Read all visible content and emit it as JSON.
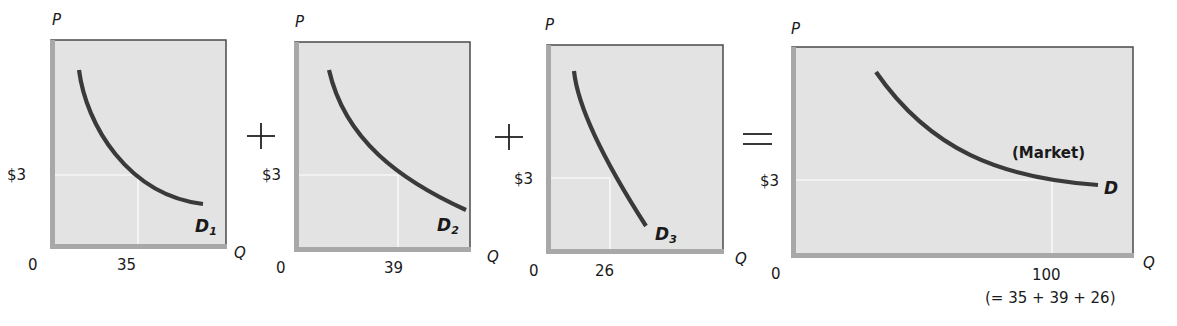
{
  "chart_data": {
    "type": "line",
    "colors": {
      "panel_fill": "#e3e3e3",
      "axis_band": "#a8a8a8",
      "border": "#4a4a4a",
      "curve": "#3a3a3a",
      "guide": "#ffffff"
    },
    "operators": [
      "+",
      "+",
      "="
    ],
    "panels": [
      {
        "id": "panel-1",
        "ylabel": "P",
        "xlabel": "Q",
        "origin": "0",
        "price_tick": "$3",
        "qty_tick": "35",
        "curve_label": "D",
        "curve_sub": "1",
        "price": 3,
        "quantity": 35,
        "box": [
          51,
          40,
          226,
          248
        ],
        "guide": {
          "y": 175,
          "x": 138
        },
        "curve": "M79,70 C86,125 128,195 203,204"
      },
      {
        "id": "panel-2",
        "ylabel": "P",
        "xlabel": "Q",
        "origin": "0",
        "price_tick": "$3",
        "qty_tick": "39",
        "curve_label": "D",
        "curve_sub": "2",
        "price": 3,
        "quantity": 39,
        "box": [
          295,
          42,
          470,
          251
        ],
        "guide": {
          "y": 175,
          "x": 398
        },
        "curve": "M329,70 C345,140 400,180 466,210"
      },
      {
        "id": "panel-3",
        "ylabel": "P",
        "xlabel": "Q",
        "origin": "0",
        "price_tick": "$3",
        "qty_tick": "26",
        "curve_label": "D",
        "curve_sub": "3",
        "price": 3,
        "quantity": 26,
        "box": [
          547,
          45,
          723,
          253
        ],
        "guide": {
          "y": 178,
          "x": 610
        },
        "curve": "M574,71 C578,110 610,170 646,226"
      },
      {
        "id": "panel-market",
        "ylabel": "P",
        "xlabel": "Q",
        "origin": "0",
        "price_tick": "$3",
        "qty_tick": "100",
        "qty_note": "(= 35 + 39 + 26)",
        "curve_label": "D",
        "curve_sub": "",
        "market_label": "(Market)",
        "price": 3,
        "quantity": 100,
        "box": [
          792,
          47,
          1133,
          257
        ],
        "guide": {
          "y": 180,
          "x": 1052
        },
        "curve": "M876,72 C930,150 1000,178 1098,185"
      }
    ],
    "series": [
      {
        "name": "D1",
        "points_at_price_3": {
          "P": 3,
          "Q": 35
        }
      },
      {
        "name": "D2",
        "points_at_price_3": {
          "P": 3,
          "Q": 39
        }
      },
      {
        "name": "D3",
        "points_at_price_3": {
          "P": 3,
          "Q": 26
        }
      },
      {
        "name": "D (Market)",
        "points_at_price_3": {
          "P": 3,
          "Q": 100
        }
      }
    ],
    "annotation": "(= 35 + 39 + 26)",
    "xlabel": "Q",
    "ylabel": "P",
    "grid": false,
    "legend": "none"
  }
}
